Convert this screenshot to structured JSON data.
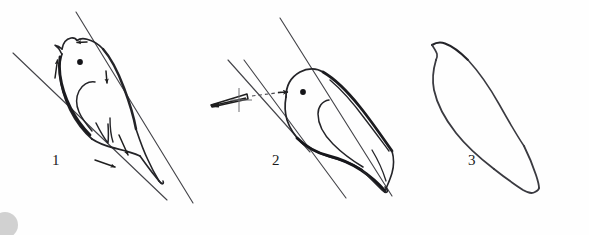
{
  "figure": {
    "type": "line-drawing-diagram",
    "background_color": "#fefefe",
    "ink_color": "#2b2b2b",
    "light_ink_color": "#6e6e72",
    "width": 589,
    "height": 235,
    "panel_count": 3
  },
  "panels": [
    {
      "number": "1",
      "label": "1",
      "label_x": 52,
      "label_y": 153,
      "description": "Bird held upright between two parallel diagonal guide lines, head up, with four directional arrows showing adjustment directions",
      "has_eye": true,
      "has_guide_lines": true,
      "guide_line_count": 2,
      "arrows": [
        {
          "name": "arrow-head-top",
          "direction": "left"
        },
        {
          "name": "arrow-nape-up",
          "direction": "up"
        },
        {
          "name": "arrow-neck-down",
          "direction": "down"
        },
        {
          "name": "arrow-tail-upper",
          "direction": "down-right"
        },
        {
          "name": "arrow-tail-lower",
          "direction": "right"
        }
      ],
      "has_instrument": false
    },
    {
      "number": "2",
      "label": "2",
      "label_x": 272,
      "label_y": 153,
      "description": "Bird rotated to a reclined diagonal position between parallel guide lines, with a forceps instrument approaching from the left along a dashed path",
      "has_eye": true,
      "has_guide_lines": true,
      "guide_line_count": 3,
      "arrows": [
        {
          "name": "arrow-instrument-approach",
          "direction": "right"
        }
      ],
      "has_instrument": true,
      "instrument": {
        "name": "forceps-tweezers",
        "points_toward": "bird-head",
        "has_crosshair_marker": true,
        "has_dashed_path": true
      }
    },
    {
      "number": "3",
      "label": "3",
      "label_x": 468,
      "label_y": 153,
      "description": "Plain outline silhouette of the bird body and tail with no internal detail, eye, guide lines or arrows",
      "has_eye": false,
      "has_guide_lines": false,
      "arrows": [],
      "has_instrument": false
    }
  ],
  "artifacts": {
    "corner_smudge": {
      "name": "scan-smudge",
      "position": "bottom-left",
      "color": "#c9c9c9",
      "shape": "partial-circle"
    }
  }
}
